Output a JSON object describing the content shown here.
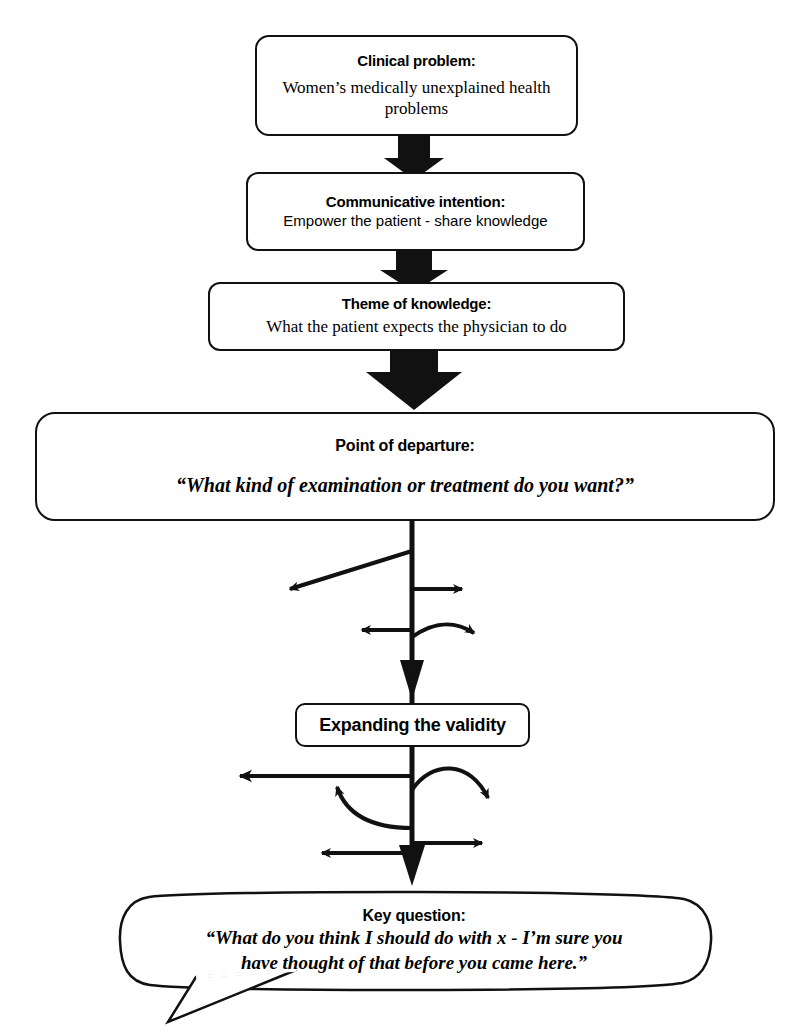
{
  "diagram": {
    "stroke_color": "#111111",
    "background_color": "#ffffff"
  },
  "nodes": [
    {
      "id": "clinical-problem",
      "title": "Clinical problem:",
      "body": "Women’s medically unexplained health problems"
    },
    {
      "id": "communicative-intention",
      "title": "Communicative intention:",
      "body": "Empower the patient - share knowledge"
    },
    {
      "id": "theme-of-knowledge",
      "title": "Theme of knowledge:",
      "body": "What the patient expects the physician to do"
    },
    {
      "id": "point-of-departure",
      "title": "Point of departure:",
      "body": "“What kind of examination or treatment do you want?”"
    },
    {
      "id": "expanding-validity",
      "title": "Expanding the validity",
      "body": ""
    },
    {
      "id": "key-question",
      "title": "Key question:",
      "body_line1": "“What do you think  I should do with x  - I’m sure you",
      "body_line2": "have thought of that before you came here.”"
    }
  ],
  "connectors": [
    {
      "id": "block-arrow-1",
      "from": "clinical-problem",
      "to": "communicative-intention",
      "style": "block-arrow"
    },
    {
      "id": "block-arrow-2",
      "from": "communicative-intention",
      "to": "theme-of-knowledge",
      "style": "block-arrow"
    },
    {
      "id": "block-arrow-3",
      "from": "theme-of-knowledge",
      "to": "point-of-departure",
      "style": "block-arrow-large"
    },
    {
      "id": "trunk-1",
      "from": "point-of-departure",
      "to": "expanding-validity",
      "style": "line-with-branches"
    },
    {
      "id": "trunk-2",
      "from": "expanding-validity",
      "to": "key-question",
      "style": "line-with-branches"
    }
  ],
  "branch_arrows": {
    "cluster_upper": [
      {
        "id": "branch-upper-diagonal-left",
        "direction": "left-down-diagonal"
      },
      {
        "id": "branch-upper-right",
        "direction": "right"
      },
      {
        "id": "branch-upper-left",
        "direction": "left"
      },
      {
        "id": "branch-upper-curve-right",
        "direction": "curve-right"
      }
    ],
    "cluster_lower": [
      {
        "id": "branch-lower-long-left",
        "direction": "left"
      },
      {
        "id": "branch-lower-curve-right",
        "direction": "curve-right-down"
      },
      {
        "id": "branch-lower-curve-up-left",
        "direction": "curve-up-left"
      },
      {
        "id": "branch-lower-left",
        "direction": "left"
      },
      {
        "id": "branch-lower-right",
        "direction": "right"
      }
    ]
  }
}
